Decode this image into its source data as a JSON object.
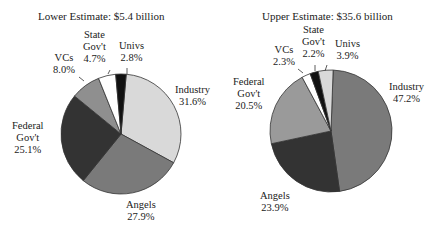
{
  "chart_data": [
    {
      "type": "pie",
      "title": "Lower Estimate: $5.4 billion",
      "categories": [
        "Industry",
        "Angels",
        "Federal Gov't",
        "VCs",
        "State Gov't",
        "Univs"
      ],
      "values": [
        31.6,
        27.9,
        25.1,
        8.0,
        4.7,
        2.8
      ],
      "unit": "%",
      "colors": [
        "#d9d9d9",
        "#7a7a7a",
        "#333333",
        "#8f8f8f",
        "#ffffff",
        "#111111"
      ],
      "start_angle_deg": 0,
      "direction": "clockwise from top, Univs slice just left of 12 o'clock"
    },
    {
      "type": "pie",
      "title": "Upper Estimate: $35.6 billion",
      "categories": [
        "Industry",
        "Angels",
        "Federal Gov't",
        "VCs",
        "State Gov't",
        "Univs"
      ],
      "values": [
        47.2,
        23.9,
        20.5,
        2.3,
        2.2,
        3.9
      ],
      "unit": "%",
      "colors": [
        "#7a7a7a",
        "#333333",
        "#9a9a9a",
        "#ffffff",
        "#111111",
        "#d9d9d9"
      ],
      "start_angle_deg": 0,
      "direction": "clockwise from top"
    }
  ],
  "left": {
    "title": "Lower Estimate: $5.4 billion",
    "labels": {
      "industry": {
        "name": "Industry",
        "pct": "31.6%"
      },
      "angels": {
        "name": "Angels",
        "pct": "27.9%"
      },
      "federal": {
        "name1": "Federal",
        "name2": "Gov't",
        "pct": "25.1%"
      },
      "vcs": {
        "name": "VCs",
        "pct": "8.0%"
      },
      "state": {
        "name1": "State",
        "name2": "Gov't",
        "pct": "4.7%"
      },
      "univs": {
        "name": "Univs",
        "pct": "2.8%"
      }
    }
  },
  "right": {
    "title": "Upper Estimate: $35.6 billion",
    "labels": {
      "industry": {
        "name": "Industry",
        "pct": "47.2%"
      },
      "angels": {
        "name": "Angels",
        "pct": "23.9%"
      },
      "federal": {
        "name1": "Federal",
        "name2": "Gov't",
        "pct": "20.5%"
      },
      "vcs": {
        "name": "VCs",
        "pct": "2.3%"
      },
      "state": {
        "name1": "State",
        "name2": "Gov't",
        "pct": "2.2%"
      },
      "univs": {
        "name": "Univs",
        "pct": "3.9%"
      }
    }
  }
}
